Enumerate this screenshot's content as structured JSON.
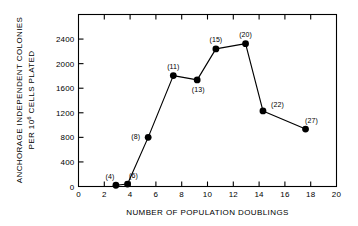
{
  "chart_data": {
    "type": "line",
    "title": "",
    "xlabel": "NUMBER OF POPULATION DOUBLINGS",
    "ylabel_line1": "ANCHORAGE INDEPENDENT COLONIES",
    "ylabel_line2_prefix": "PER 10",
    "ylabel_line2_sup": "6",
    "ylabel_line2_suffix": " CELLS PLATED",
    "xlim": [
      0,
      20
    ],
    "ylim": [
      0,
      2800
    ],
    "xticks": [
      0,
      2,
      4,
      6,
      8,
      10,
      12,
      14,
      16,
      18,
      20
    ],
    "xtick_labels": [
      "0",
      "2",
      "4",
      "6",
      "8",
      "10",
      "12",
      "14",
      "16",
      "18",
      "20"
    ],
    "yticks": [
      0,
      400,
      800,
      1200,
      1600,
      2000,
      2400
    ],
    "ytick_labels": [
      "0",
      "400",
      "800",
      "1200",
      "1600",
      "2000",
      "2400"
    ],
    "grid": false,
    "legend": "none",
    "marker": "filled-circle",
    "x": [
      2.9,
      3.8,
      5.4,
      7.35,
      9.2,
      10.65,
      12.95,
      14.3,
      17.6
    ],
    "values": [
      20,
      40,
      800,
      1805,
      1735,
      2240,
      2325,
      1230,
      935
    ],
    "point_labels": [
      "(4)",
      "(6)",
      "(8)",
      "(11)",
      "(13)",
      "(15)",
      "(20)",
      "(22)",
      "(27)"
    ],
    "label_positions": [
      "above-left",
      "above-right",
      "left",
      "above",
      "below",
      "above",
      "above",
      "right",
      "above-right"
    ],
    "series": [
      {
        "name": "anchorage independent colonies",
        "x": [
          2.9,
          3.8,
          5.4,
          7.35,
          9.2,
          10.65,
          12.95,
          14.3,
          17.6
        ],
        "values": [
          20,
          40,
          800,
          1805,
          1735,
          2240,
          2325,
          1230,
          935
        ],
        "labels": [
          "(4)",
          "(6)",
          "(8)",
          "(11)",
          "(13)",
          "(15)",
          "(20)",
          "(22)",
          "(27)"
        ]
      }
    ],
    "colors": {
      "line": "#000000",
      "marker": "#000000",
      "axis": "#000000",
      "background": "#ffffff"
    }
  }
}
